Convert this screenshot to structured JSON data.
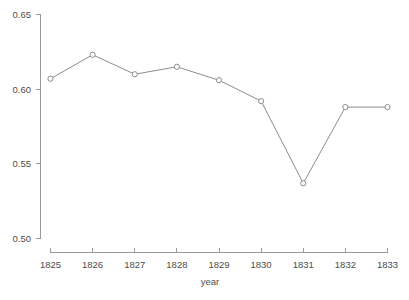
{
  "chart_data": {
    "type": "line",
    "title": "",
    "subtitle": "",
    "xlabel": "year",
    "ylabel": "",
    "categories": [
      "1825",
      "1826",
      "1827",
      "1828",
      "1829",
      "1830",
      "1831",
      "1832",
      "1833"
    ],
    "x": [
      1825,
      1826,
      1827,
      1828,
      1829,
      1830,
      1831,
      1832,
      1833
    ],
    "values": [
      0.607,
      0.623,
      0.61,
      0.615,
      0.606,
      0.592,
      0.537,
      0.588,
      0.588
    ],
    "series": [
      {
        "name": "",
        "values": [
          0.607,
          0.623,
          0.61,
          0.615,
          0.606,
          0.592,
          0.537,
          0.588,
          0.588
        ]
      }
    ],
    "xlim": [
      1825,
      1833
    ],
    "ylim": [
      0.5,
      0.65
    ],
    "xticks": [
      "1825",
      "1826",
      "1827",
      "1828",
      "1829",
      "1830",
      "1831",
      "1832",
      "1833"
    ],
    "yticks": [
      "0.50",
      "0.55",
      "0.60",
      "0.65"
    ],
    "ytick_values": [
      0.5,
      0.55,
      0.6,
      0.65
    ],
    "grid": false,
    "legend": false,
    "legend_position": "none",
    "marker": "open-circle",
    "annotations": [],
    "colors": {
      "line": "#8c8c8c",
      "marker_fill": "#ffffff",
      "marker_stroke": "#8c8c8c",
      "axis": "#9a9a9a",
      "text": "#4d4d4d",
      "background": "#ffffff"
    }
  },
  "axis": {
    "x_title": "year",
    "y_title": ""
  }
}
